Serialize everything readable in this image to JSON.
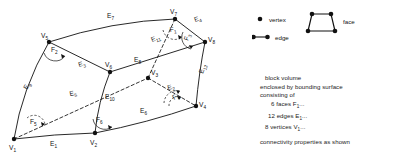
{
  "diagram": {
    "vertices": [
      {
        "name": "V1",
        "label": "V",
        "sub": "1",
        "x": 14,
        "y": 139
      },
      {
        "name": "V2",
        "label": "V",
        "sub": "2",
        "x": 95,
        "y": 133
      },
      {
        "name": "V3",
        "label": "V",
        "sub": "3",
        "x": 148,
        "y": 78
      },
      {
        "name": "V4",
        "label": "V",
        "sub": "4",
        "x": 196,
        "y": 106
      },
      {
        "name": "V5",
        "label": "V",
        "sub": "5",
        "x": 49,
        "y": 42
      },
      {
        "name": "V6",
        "label": "V",
        "sub": "6",
        "x": 110,
        "y": 72
      },
      {
        "name": "V7",
        "label": "V",
        "sub": "7",
        "x": 175,
        "y": 19
      },
      {
        "name": "V8",
        "label": "V",
        "sub": "8",
        "x": 205,
        "y": 42
      }
    ],
    "edges": [
      {
        "name": "E1",
        "label": "E",
        "sub": "1",
        "lx": 50,
        "ly": 146
      },
      {
        "name": "E2",
        "label": "E",
        "sub": "2",
        "lx": 168,
        "ly": 90
      },
      {
        "name": "E3",
        "label": "E",
        "sub": "3",
        "lx": 79,
        "ly": 67
      },
      {
        "name": "E4",
        "label": "E",
        "sub": "4",
        "lx": 195,
        "ly": 22
      },
      {
        "name": "E5",
        "label": "E",
        "sub": "5",
        "lx": 70,
        "ly": 96
      },
      {
        "name": "E6",
        "label": "E",
        "sub": "6",
        "lx": 140,
        "ly": 113
      },
      {
        "name": "E7",
        "label": "E",
        "sub": "7",
        "lx": 107,
        "ly": 18
      },
      {
        "name": "E8",
        "label": "E",
        "sub": "8",
        "lx": 134,
        "ly": 62
      },
      {
        "name": "E9",
        "label": "E",
        "sub": "9",
        "lx": 27,
        "ly": 90
      },
      {
        "name": "E10",
        "label": "E",
        "sub": "10",
        "lx": 108,
        "ly": 99
      },
      {
        "name": "E11",
        "label": "E",
        "sub": "11",
        "lx": 155,
        "ly": 42
      },
      {
        "name": "E12",
        "label": "E",
        "sub": "12",
        "lx": 206,
        "ly": 74
      }
    ],
    "faces": [
      {
        "name": "F1",
        "label": "F",
        "sub": "1",
        "lx": 172,
        "ly": 31
      },
      {
        "name": "F2",
        "label": "F",
        "sub": "2",
        "lx": 53,
        "ly": 53
      },
      {
        "name": "F3",
        "label": "F",
        "sub": "3",
        "lx": 190,
        "ly": 40
      },
      {
        "name": "F4",
        "label": "F",
        "sub": "4",
        "lx": 178,
        "ly": 100
      },
      {
        "name": "F5",
        "label": "F",
        "sub": "5",
        "lx": 33,
        "ly": 124
      },
      {
        "name": "F6",
        "label": "F",
        "sub": "6",
        "lx": 99,
        "ly": 122
      }
    ]
  },
  "legend": {
    "vertex_label": "vertex",
    "edge_label": "edge",
    "face_label": "face"
  },
  "notes": {
    "line1": "block volume",
    "line2": "enclosed by bounding surface",
    "line3": "consisting of",
    "faces_count": "6 faces F",
    "faces_sub": "1",
    "faces_tail": "...",
    "edges_count": "12 edges E",
    "edges_sub": "1",
    "edges_tail": "...",
    "vertices_count": "8 vertices V",
    "vertices_sub": "1",
    "vertices_tail": "...",
    "line_last": "connectivity properties as shown"
  }
}
